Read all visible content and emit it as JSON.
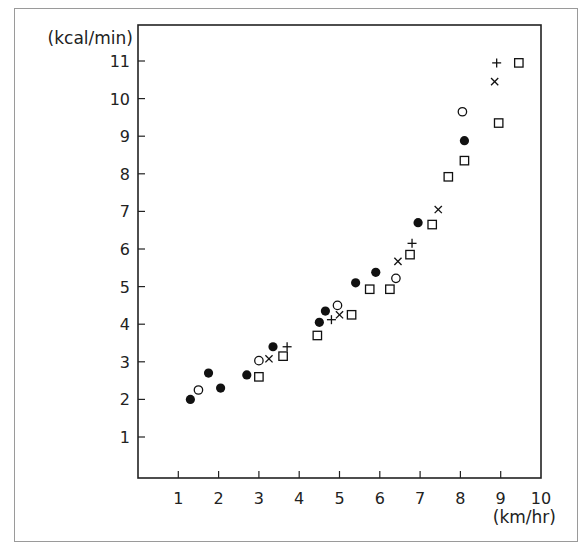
{
  "chart_data": {
    "type": "scatter",
    "title": "",
    "xlabel": "(km/hr)",
    "ylabel": "(kcal/min)",
    "xlim": [
      0,
      10
    ],
    "ylim": [
      0,
      11.5
    ],
    "x_ticks": [
      1,
      2,
      3,
      4,
      5,
      6,
      7,
      8,
      9,
      10
    ],
    "x_tick_labels": [
      "1",
      "2",
      "3",
      "4",
      "5",
      "6",
      "7",
      "8",
      "9",
      "10"
    ],
    "y_ticks": [
      1,
      2,
      3,
      4,
      5,
      6,
      7,
      8,
      9,
      10,
      11
    ],
    "y_tick_labels": [
      "1",
      "2",
      "3",
      "4",
      "5",
      "6",
      "7",
      "8",
      "9",
      "10",
      "11"
    ],
    "grid": false,
    "legend": "none",
    "series": [
      {
        "name": "filled-circle",
        "marker": "filled-circle",
        "color": "#111111",
        "points": [
          [
            1.3,
            2.0
          ],
          [
            1.75,
            2.7
          ],
          [
            2.05,
            2.3
          ],
          [
            2.7,
            2.65
          ],
          [
            3.35,
            3.4
          ],
          [
            4.5,
            4.05
          ],
          [
            4.65,
            4.35
          ],
          [
            5.4,
            5.1
          ],
          [
            5.9,
            5.38
          ],
          [
            6.95,
            6.7
          ],
          [
            8.1,
            8.88
          ]
        ]
      },
      {
        "name": "open-circle",
        "marker": "open-circle",
        "color": "#111111",
        "points": [
          [
            1.5,
            2.25
          ],
          [
            3.0,
            3.03
          ],
          [
            4.95,
            4.5
          ],
          [
            6.4,
            5.22
          ],
          [
            8.05,
            9.65
          ]
        ]
      },
      {
        "name": "cross",
        "marker": "x",
        "color": "#111111",
        "points": [
          [
            3.25,
            3.08
          ],
          [
            5.0,
            4.25
          ],
          [
            6.45,
            5.67
          ],
          [
            7.45,
            7.05
          ],
          [
            8.85,
            10.45
          ]
        ]
      },
      {
        "name": "plus",
        "marker": "plus",
        "color": "#111111",
        "points": [
          [
            3.7,
            3.4
          ],
          [
            4.8,
            4.12
          ],
          [
            6.8,
            6.15
          ],
          [
            8.9,
            10.95
          ]
        ]
      },
      {
        "name": "open-square",
        "marker": "open-square",
        "color": "#111111",
        "points": [
          [
            3.0,
            2.6
          ],
          [
            3.6,
            3.15
          ],
          [
            4.45,
            3.7
          ],
          [
            5.3,
            4.25
          ],
          [
            5.75,
            4.93
          ],
          [
            6.25,
            4.93
          ],
          [
            6.75,
            5.85
          ],
          [
            7.3,
            6.65
          ],
          [
            7.7,
            7.92
          ],
          [
            8.1,
            8.35
          ],
          [
            8.95,
            9.35
          ],
          [
            9.45,
            10.95
          ]
        ]
      }
    ]
  }
}
